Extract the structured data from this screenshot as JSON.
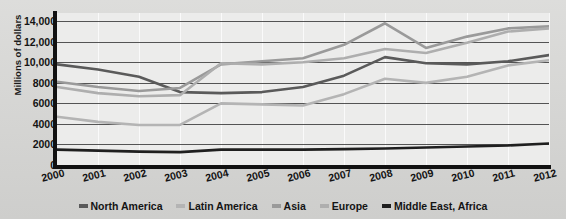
{
  "chart_data": {
    "type": "line",
    "title": "",
    "xlabel": "",
    "ylabel": "Millions of dollars",
    "x": [
      2000,
      2001,
      2002,
      2003,
      2004,
      2005,
      2006,
      2007,
      2008,
      2009,
      2010,
      2011,
      2012
    ],
    "xtick_labels": [
      "2000",
      "2001",
      "2002",
      "2003",
      "2004",
      "2005",
      "2006",
      "2007",
      "2008",
      "2009",
      "2010",
      "2011",
      "2012"
    ],
    "ytick_labels": [
      "14,000",
      "12,000",
      "10,000",
      "8000",
      "6000",
      "4000",
      "2000",
      "0"
    ],
    "ytick_values": [
      14000,
      12000,
      10000,
      8000,
      6000,
      4000,
      2000,
      0
    ],
    "ylim": [
      0,
      14800
    ],
    "xlim": [
      2000,
      2012
    ],
    "grid": "horizontal",
    "legend_position": "bottom",
    "series": [
      {
        "name": "North America",
        "color": "#5a5a5a",
        "values": [
          9800,
          9300,
          8600,
          7100,
          7000,
          7100,
          7600,
          8700,
          10500,
          9900,
          9800,
          10100,
          10700
        ]
      },
      {
        "name": "Latin America",
        "color": "#b4b4b4",
        "values": [
          4700,
          4200,
          3900,
          3900,
          6000,
          5900,
          5800,
          6900,
          8400,
          8000,
          8600,
          9700,
          10200
        ]
      },
      {
        "name": "Asia",
        "color": "#9a9a9a",
        "values": [
          8100,
          7600,
          7200,
          7500,
          9800,
          10100,
          10400,
          11700,
          13800,
          11400,
          12500,
          13300,
          13500
        ]
      },
      {
        "name": "Europe",
        "color": "#aeaeae",
        "values": [
          7600,
          7000,
          6700,
          6800,
          9900,
          9800,
          10000,
          10400,
          11300,
          10900,
          11900,
          13000,
          13300
        ]
      },
      {
        "name": "Middle East, Africa",
        "color": "#1f1f1f",
        "values": [
          1500,
          1400,
          1300,
          1250,
          1500,
          1500,
          1500,
          1550,
          1600,
          1700,
          1800,
          1900,
          2100
        ]
      }
    ]
  },
  "legend": {
    "items": [
      {
        "label": "North America"
      },
      {
        "label": "Latin America"
      },
      {
        "label": "Asia"
      },
      {
        "label": "Europe"
      },
      {
        "label": "Middle East, Africa"
      }
    ]
  }
}
